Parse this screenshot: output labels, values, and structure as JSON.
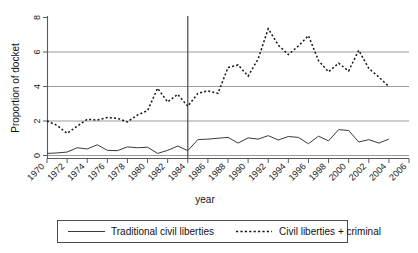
{
  "chart_data": {
    "type": "line",
    "title": "",
    "xlabel": "year",
    "ylabel": "Proportion of docket",
    "xlim": [
      1970,
      2006
    ],
    "ylim": [
      0,
      8
    ],
    "xticks": [
      1970,
      1972,
      1974,
      1976,
      1978,
      1980,
      1982,
      1984,
      1986,
      1988,
      1990,
      1992,
      1994,
      1996,
      1998,
      2000,
      2002,
      2004,
      2006
    ],
    "xtick_labels": [
      "1970",
      "1972",
      "1974",
      "1976",
      "1978",
      "1980",
      "1982",
      "1984",
      "1986",
      "1988",
      "1990",
      "1992",
      "1994",
      "1996",
      "1998",
      "2000",
      "2002",
      "2004",
      "2006"
    ],
    "yticks": [
      0,
      2,
      4,
      6,
      8
    ],
    "ytick_labels": [
      "0",
      "2",
      "4",
      "6",
      "8"
    ],
    "grid": "horizontal",
    "legend_position": "below-axes",
    "annotations": [
      {
        "type": "vertical-reference-line",
        "x": 1984,
        "label": ""
      }
    ],
    "x": [
      1970,
      1971,
      1972,
      1973,
      1974,
      1975,
      1976,
      1977,
      1978,
      1979,
      1980,
      1981,
      1982,
      1983,
      1984,
      1985,
      1986,
      1987,
      1988,
      1989,
      1990,
      1991,
      1992,
      1993,
      1994,
      1995,
      1996,
      1997,
      1998,
      1999,
      2000,
      2001,
      2002,
      2003,
      2004
    ],
    "series": [
      {
        "name": "Traditional civil liberties",
        "style": "solid",
        "color": "#3a3a3a",
        "values": [
          0.12,
          0.15,
          0.2,
          0.45,
          0.38,
          0.62,
          0.3,
          0.28,
          0.5,
          0.45,
          0.48,
          0.12,
          0.3,
          0.55,
          0.28,
          0.92,
          0.95,
          1.0,
          1.05,
          0.72,
          1.02,
          0.95,
          1.15,
          0.9,
          1.1,
          1.05,
          0.68,
          1.12,
          0.85,
          1.5,
          1.45,
          0.78,
          0.92,
          0.72,
          0.95
        ]
      },
      {
        "name": "Civil liberties + criminal",
        "style": "dotted",
        "color": "#141414",
        "values": [
          2.0,
          1.75,
          1.28,
          1.7,
          2.1,
          2.05,
          2.2,
          2.15,
          1.95,
          2.35,
          2.6,
          3.9,
          3.1,
          3.55,
          2.85,
          3.6,
          3.75,
          3.6,
          5.1,
          5.25,
          4.6,
          5.6,
          7.35,
          6.4,
          5.85,
          6.35,
          6.95,
          5.5,
          4.85,
          5.35,
          4.9,
          6.1,
          5.05,
          4.55,
          4.0
        ]
      }
    ]
  },
  "legend": {
    "entries": [
      {
        "label": "Traditional civil liberties",
        "style": "solid"
      },
      {
        "label": "Civil liberties + criminal",
        "style": "dotted"
      }
    ]
  }
}
